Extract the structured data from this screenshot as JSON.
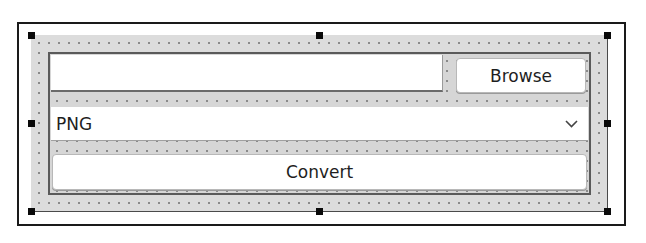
{
  "form": {
    "file_path_input": {
      "value": "",
      "placeholder": ""
    },
    "browse_button": {
      "label": "Browse"
    },
    "format_combo": {
      "selected": "PNG",
      "icon": "chevron-down-icon"
    },
    "convert_button": {
      "label": "Convert"
    }
  },
  "selection": {
    "handles": [
      "top-left",
      "top-middle",
      "top-right",
      "middle-left",
      "middle-right",
      "bottom-left",
      "bottom-middle",
      "bottom-right"
    ]
  },
  "colors": {
    "container_bg": "#dcdcdc",
    "frame_border": "#5a5a5a",
    "handle": "#0a0a0a",
    "window_border": "#1a1a1a"
  }
}
